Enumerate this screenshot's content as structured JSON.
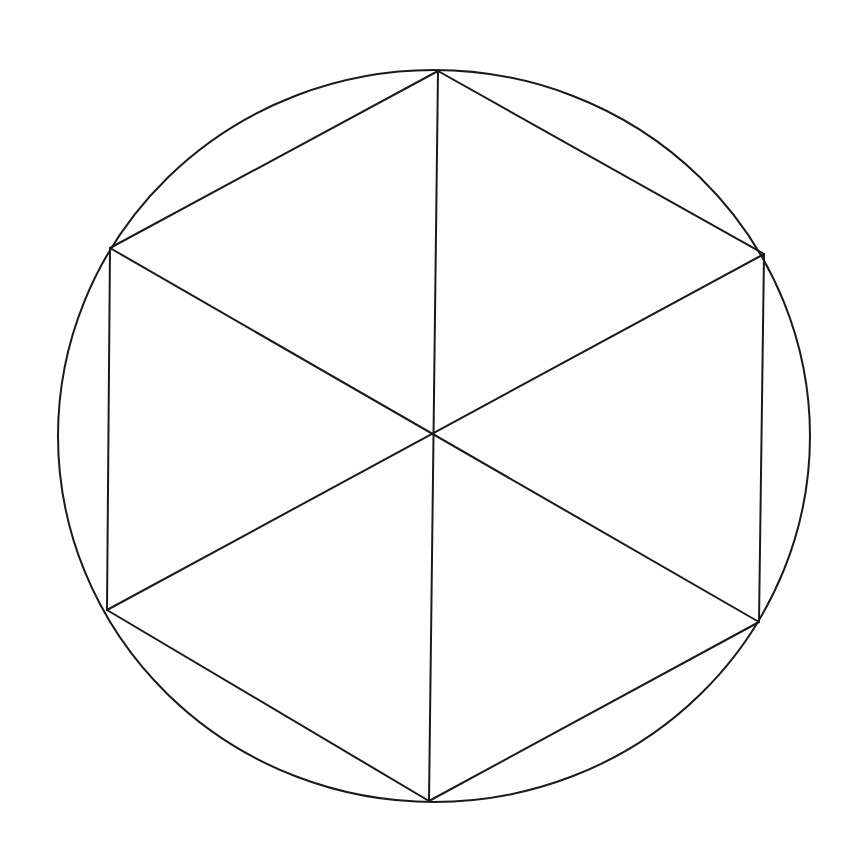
{
  "figure": {
    "title": "Regular hexagon inscribed in a circle with center diagonals",
    "background_color": "#ffffff",
    "stroke_color": "#1a1a1a",
    "stroke_width": 2,
    "canvas": {
      "width": 861,
      "height": 847
    }
  },
  "chart_data": {
    "type": "diagram",
    "xlabel": "",
    "ylabel": "",
    "xlim": [
      0,
      861
    ],
    "ylim": [
      0,
      847
    ],
    "grid": false,
    "legend": "none",
    "shapes": [
      {
        "name": "circumscribed-circle",
        "kind": "ellipse",
        "cx": 434,
        "cy": 436,
        "rx": 376,
        "ry": 366,
        "fill": "none",
        "stroke": "#1a1a1a"
      },
      {
        "name": "inscribed-hexagon",
        "kind": "polygon",
        "points": [
          [
            438,
            71
          ],
          [
            764,
            254
          ],
          [
            759,
            622
          ],
          [
            429,
            801
          ],
          [
            107,
            610
          ],
          [
            110,
            248
          ]
        ],
        "fill": "none",
        "stroke": "#1a1a1a"
      }
    ],
    "center_point": {
      "name": "hexagon-center",
      "x": 434,
      "y": 433
    },
    "diagonals": [
      {
        "name": "diagonal-vertical",
        "from": [
          438,
          71
        ],
        "to": [
          429,
          801
        ]
      },
      {
        "name": "diagonal-upper-left-to-lower-right",
        "from": [
          110,
          248
        ],
        "to": [
          759,
          622
        ]
      },
      {
        "name": "diagonal-upper-right-to-lower-left",
        "from": [
          764,
          254
        ],
        "to": [
          107,
          610
        ]
      }
    ],
    "vertices": [
      {
        "label": "top",
        "x": 438,
        "y": 71
      },
      {
        "label": "upper-right",
        "x": 764,
        "y": 254
      },
      {
        "label": "lower-right",
        "x": 759,
        "y": 622
      },
      {
        "label": "bottom",
        "x": 429,
        "y": 801
      },
      {
        "label": "lower-left",
        "x": 107,
        "y": 610
      },
      {
        "label": "upper-left",
        "x": 110,
        "y": 248
      }
    ],
    "triangle_count": 6,
    "annotations": []
  }
}
